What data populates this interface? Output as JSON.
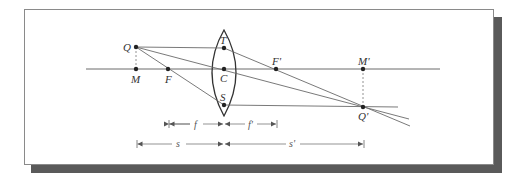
{
  "figure": {
    "type": "thin converging lens ray diagram",
    "colors": {
      "line": "#6a6a6a",
      "point": "#222222",
      "frame": "#8a8a8a",
      "shadow": "#5a5a5a"
    },
    "points": {
      "Q": {
        "label": "Q",
        "x": 136,
        "y": 47
      },
      "M": {
        "label": "M",
        "x": 136,
        "y": 69
      },
      "F": {
        "label": "F",
        "x": 168,
        "y": 69
      },
      "T": {
        "label": "T",
        "x": 224,
        "y": 48
      },
      "C": {
        "label": "C",
        "x": 224,
        "y": 69
      },
      "S": {
        "label": "S",
        "x": 224,
        "y": 105
      },
      "F_prime": {
        "label": "F'",
        "x": 276,
        "y": 69
      },
      "M_prime": {
        "label": "M'",
        "x": 363,
        "y": 69
      },
      "Q_prime": {
        "label": "Q'",
        "x": 363,
        "y": 107
      }
    },
    "dimensions": {
      "f": {
        "label": "f"
      },
      "f_prime": {
        "label": "f'"
      },
      "s": {
        "label": "s"
      },
      "s_prime": {
        "label": "s'"
      }
    }
  }
}
